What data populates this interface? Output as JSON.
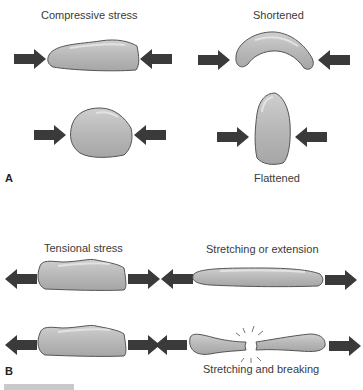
{
  "panels": {
    "a": {
      "letter": "A",
      "title_left": "Compressive stress",
      "title_right": "Shortened",
      "result_label": "Flattened"
    },
    "b": {
      "letter": "B",
      "title_left": "Tensional stress",
      "title_right": "Stretching or extension",
      "result_label": "Stretching and breaking"
    }
  },
  "colors": {
    "arrow": "#3a3a3a",
    "body_fill": "#b4b4b4",
    "body_stroke": "#555555",
    "highlight": "#d6d6d6"
  }
}
